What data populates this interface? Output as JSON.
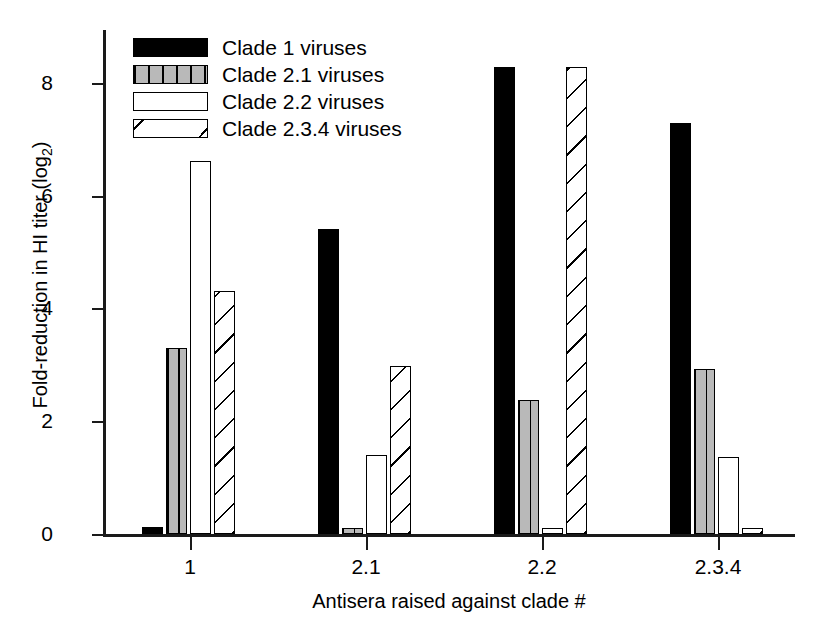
{
  "chart_data": {
    "type": "bar",
    "title": "",
    "xlabel": "Antisera raised against clade #",
    "ylabel": "Fold-reduction in HI titer (log2)",
    "ylabel_base": "Fold-reduction in HI titer (log",
    "ylabel_sub": "2",
    "ylabel_tail": ")",
    "categories": [
      "1",
      "2.1",
      "2.2",
      "2.3.4"
    ],
    "ylim": [
      0,
      8.9
    ],
    "yticks": [
      0,
      2,
      4,
      6,
      8
    ],
    "ytick_labels": [
      "0",
      "2",
      "4",
      "6",
      "8"
    ],
    "grid": false,
    "legend_position": "top-left",
    "series": [
      {
        "name": "Clade 1 viruses",
        "fill": "solid-black",
        "values": [
          0.12,
          5.4,
          8.28,
          7.28
        ]
      },
      {
        "name": "Clade 2.1 viruses",
        "fill": "gray-vertical-lines",
        "values": [
          3.3,
          0.1,
          2.37,
          2.93
        ]
      },
      {
        "name": "Clade 2.2 viruses",
        "fill": "open-white",
        "values": [
          6.62,
          1.4,
          0.1,
          1.37
        ]
      },
      {
        "name": "Clade 2.3.4 viruses",
        "fill": "diagonal-hatch",
        "values": [
          4.3,
          2.98,
          8.28,
          0.09
        ]
      }
    ]
  },
  "colors": {
    "axis": "#1a1a1a",
    "series_black": "#000000",
    "series_gray": "#b9b9b9",
    "background": "#ffffff"
  }
}
